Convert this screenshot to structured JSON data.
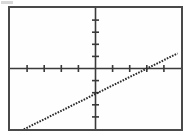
{
  "window": {
    "title": "Graphing Calculator Screen",
    "background_color": "#ffffff"
  },
  "panel": {
    "name": "graph-panel",
    "border_color": "#4a4a4a",
    "fill_color": "#fefefe",
    "left": 8,
    "top": 6,
    "width": 175,
    "height": 125
  },
  "artifact": {
    "label": "",
    "color": "#d8d8d8"
  },
  "chart_data": {
    "type": "line",
    "title": "",
    "subtitle": "",
    "xlabel": "",
    "ylabel": "",
    "grid": false,
    "legend": null,
    "axis_color": "#3a3a3a",
    "line_color": "#2b2b2b",
    "line_style": "dotted",
    "xlim": [
      -10,
      10
    ],
    "ylim": [
      -10,
      10
    ],
    "x_axis_y_value": 0,
    "y_axis_x_value": 0,
    "x_tick_step": 2,
    "y_tick_step": 2,
    "x_ticks": [
      -8,
      -6,
      -4,
      -2,
      2,
      4,
      6,
      8
    ],
    "y_ticks": [
      -8,
      -6,
      -4,
      -2,
      2,
      4,
      6,
      8
    ],
    "tick_labels_shown": false,
    "series": [
      {
        "name": "line-1",
        "equation": "y = 0.7x - 4.2",
        "slope": 0.7,
        "intercept": -4.2,
        "x": [
          -9.6,
          9.6
        ],
        "values": [
          -10.9,
          2.5
        ],
        "x_intercept": 6.0,
        "y_intercept": -4.2
      }
    ],
    "annotations": []
  }
}
